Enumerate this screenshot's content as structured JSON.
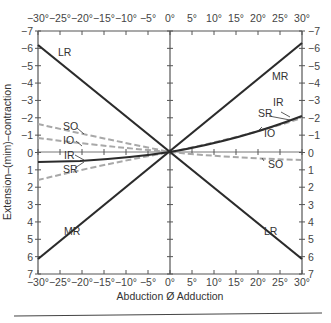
{
  "chart_data": {
    "type": "line",
    "title": "",
    "xlabel": "Abduction Ø Adduction",
    "ylabel": "Extension–(mim)–contraction",
    "xlim": [
      -30,
      30
    ],
    "ylim": [
      -7,
      7
    ],
    "y_inverted": true,
    "grid": false,
    "x_ticks": [
      "−30°",
      "−25°",
      "−20°",
      "−15°",
      "−10°",
      "−5°",
      "0°",
      "5°",
      "10°",
      "15°",
      "20°",
      "25°",
      "30°"
    ],
    "y_ticks_left": [
      "−7",
      "−6",
      "−5",
      "−4",
      "−3",
      "−2",
      "−1",
      "0",
      "1",
      "2",
      "3",
      "4",
      "5",
      "6",
      "7"
    ],
    "y_ticks_right": [
      "−7",
      "−6",
      "−5",
      "−4",
      "−3",
      "−2",
      "−1",
      "0",
      "1",
      "2",
      "3",
      "4",
      "5",
      "6",
      "7"
    ],
    "series": [
      {
        "name": "LR",
        "style": "solid",
        "x": [
          -30,
          0,
          30
        ],
        "values": [
          -6.2,
          0,
          6.2
        ]
      },
      {
        "name": "MR",
        "style": "solid",
        "x": [
          -30,
          0,
          30
        ],
        "values": [
          6.2,
          0,
          -6.3
        ]
      },
      {
        "name": "SR",
        "style": "solid",
        "x": [
          -30,
          -20,
          -10,
          0,
          10,
          20,
          30
        ],
        "values": [
          0.6,
          0.5,
          0.3,
          0,
          -0.6,
          -1.3,
          -2.1
        ]
      },
      {
        "name": "IR",
        "style": "solid",
        "x": [
          -30,
          -20,
          -10,
          0,
          10,
          20,
          30
        ],
        "values": [
          0.6,
          0.5,
          0.3,
          0,
          -0.6,
          -1.3,
          -2.1
        ]
      },
      {
        "name": "SO",
        "style": "dashed",
        "x": [
          -30,
          -20,
          -10,
          0,
          10,
          20,
          30
        ],
        "values": [
          -1.6,
          -1.0,
          -0.5,
          0,
          0.35,
          0.45,
          0.45
        ]
      },
      {
        "name": "IO",
        "style": "dashed",
        "x": [
          -30,
          -20,
          -10,
          0,
          10,
          20,
          30
        ],
        "values": [
          -0.8,
          -0.5,
          -0.25,
          0,
          -0.6,
          -1.2,
          -1.9
        ]
      }
    ],
    "annotations": [
      "LR",
      "MR",
      "SO",
      "IO",
      "IR",
      "SR",
      "MR",
      "LR",
      "SR",
      "IR",
      "IO",
      "SO"
    ]
  },
  "labels": {
    "top_left_lr": "LR",
    "top_right_mr": "MR",
    "bottom_left_mr": "MR",
    "bottom_right_lr": "LR",
    "left_so": "SO",
    "left_io": "IO",
    "left_ir": "IR",
    "left_sr": "SR",
    "right_sr": "SR",
    "right_ir": "IR",
    "right_io": "IO",
    "right_so": "SO"
  },
  "colors": {
    "solid_line": "#2b2b2b",
    "dashed_line": "#a8a8a8",
    "axis": "#444444"
  }
}
